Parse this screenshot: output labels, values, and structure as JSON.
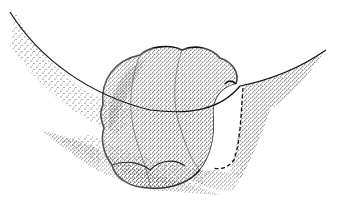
{
  "illustration": {
    "style": "stipple pen-and-ink drawing",
    "subject": "lobulated mass protruding over a curved membrane fold",
    "colors": {
      "background": "#ffffff",
      "ink": "#111111"
    },
    "elements": [
      "curved-membrane-line",
      "stippled-left-tissue",
      "lobulated-mass",
      "white-cut-surface",
      "dashed-outline",
      "stippled-right-tissue"
    ]
  }
}
